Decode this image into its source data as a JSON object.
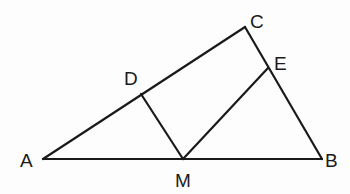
{
  "diagram": {
    "type": "geometry",
    "points": {
      "A": {
        "x": 43,
        "y": 159
      },
      "B": {
        "x": 322,
        "y": 159
      },
      "C": {
        "x": 245,
        "y": 27
      },
      "M": {
        "x": 183,
        "y": 159
      },
      "D": {
        "x": 141,
        "y": 94
      },
      "E": {
        "x": 268,
        "y": 68
      }
    },
    "labels": {
      "A": "A",
      "B": "B",
      "C": "C",
      "D": "D",
      "E": "E",
      "M": "M"
    },
    "segments": [
      [
        "A",
        "B"
      ],
      [
        "A",
        "C"
      ],
      [
        "C",
        "B"
      ],
      [
        "D",
        "M"
      ],
      [
        "M",
        "E"
      ]
    ],
    "line_color": "#1a1a1a",
    "background": "#fdfdfd"
  }
}
